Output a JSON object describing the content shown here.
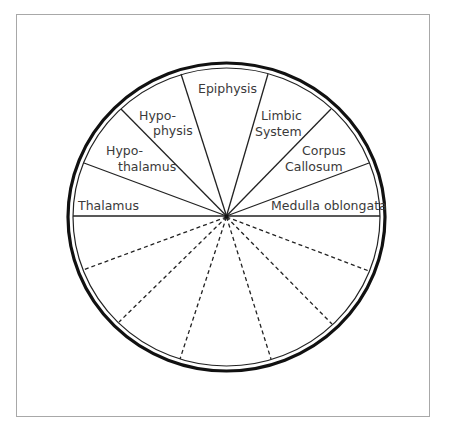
{
  "diagram": {
    "type": "wheel",
    "center": [
      226.5,
      216
    ],
    "labels": {
      "thalamus": "Thalamus",
      "hypothalamus_1": "Hypo-",
      "hypothalamus_2": "thalamus",
      "hypophysis_1": "Hypo-",
      "hypophysis_2": "physis",
      "epiphysis": "Epiphysis",
      "limbic_1": "Limbic",
      "limbic_2": "System",
      "corpus_1": "Corpus",
      "corpus_2": "Callosum",
      "medulla": "Medulla oblongata"
    },
    "upper_segments": [
      "Thalamus",
      "Hypothalamus",
      "Hypophysis",
      "Epiphysis",
      "Limbic System",
      "Corpus Callosum",
      "Medulla oblongata"
    ],
    "lower_segments_blank": 7,
    "colors": {
      "stroke": "#1a1a1a",
      "frame": "#a8a8a8",
      "text": "#3a3a3a"
    }
  }
}
